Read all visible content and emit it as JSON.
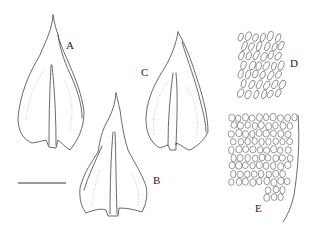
{
  "figure": {
    "type": "botanical plate",
    "panels": [
      {
        "id": "leaf-a",
        "label": "A",
        "kind": "leaf"
      },
      {
        "id": "leaf-b",
        "label": "B",
        "kind": "leaf"
      },
      {
        "id": "leaf-c",
        "label": "C",
        "kind": "leaf"
      },
      {
        "id": "cells-d",
        "label": "D",
        "kind": "cell-detail"
      },
      {
        "id": "cells-e",
        "label": "E",
        "kind": "cell-detail"
      }
    ],
    "scale_bar": {
      "label": ""
    },
    "colors": {
      "line": "#444444",
      "stipple": "#bbbbbb",
      "background": "#ffffff"
    }
  }
}
